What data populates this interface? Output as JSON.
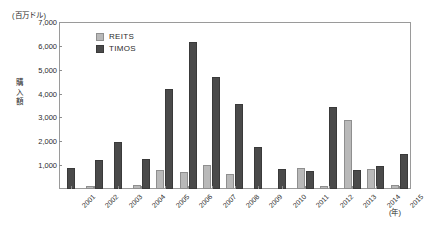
{
  "chart_data": {
    "type": "bar",
    "title": "",
    "unit_caption": "(百万ドル)",
    "ylabel": "購入額",
    "xlabel": "(年)",
    "ylim": [
      0,
      7000
    ],
    "ytick_labels": [
      "7,000",
      "6,000",
      "5,000",
      "4,000",
      "3,000",
      "2,000",
      "1,000"
    ],
    "ytick_values": [
      7000,
      6000,
      5000,
      4000,
      3000,
      2000,
      1000
    ],
    "grid": false,
    "legend_position": "top-left-inside",
    "categories": [
      "2001",
      "2002",
      "2003",
      "2004",
      "2005",
      "2006",
      "2007",
      "2008",
      "2009",
      "2010",
      "2011",
      "2012",
      "2013",
      "2014",
      "2015"
    ],
    "series": [
      {
        "name": "REITS",
        "color": "#b9b9b9",
        "values": [
          0,
          120,
          0,
          170,
          800,
          700,
          1000,
          620,
          0,
          0,
          900,
          110,
          2900,
          850,
          150
        ]
      },
      {
        "name": "TIMOS",
        "color": "#4a4a4a",
        "values": [
          900,
          1200,
          1950,
          1250,
          4200,
          6150,
          4700,
          3550,
          1750,
          850,
          760,
          3450,
          800,
          950,
          1450
        ]
      }
    ]
  },
  "legend": {
    "items": [
      {
        "label": "REITS",
        "key": "reits"
      },
      {
        "label": "TIMOS",
        "key": "timos"
      }
    ]
  }
}
